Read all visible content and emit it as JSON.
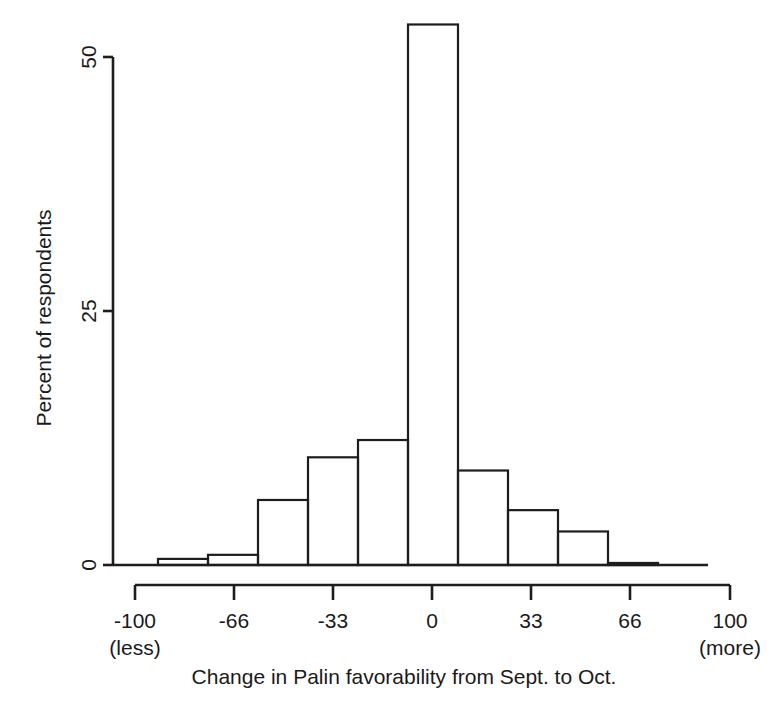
{
  "chart_data": {
    "type": "bar",
    "title": "",
    "subtitle": "",
    "xlabel": "Change in Palin favorability from Sept. to Oct.",
    "ylabel": "Percent of respondents",
    "xlim": [
      -110,
      110
    ],
    "ylim": [
      0,
      55
    ],
    "grid": false,
    "legend": null,
    "x_ticks": [
      {
        "value": -100,
        "label": "-100",
        "sublabel": "(less)"
      },
      {
        "value": -66,
        "label": "-66",
        "sublabel": ""
      },
      {
        "value": -33,
        "label": "-33",
        "sublabel": ""
      },
      {
        "value": 0,
        "label": "0",
        "sublabel": ""
      },
      {
        "value": 33,
        "label": "33",
        "sublabel": ""
      },
      {
        "value": 66,
        "label": "66",
        "sublabel": ""
      },
      {
        "value": 100,
        "label": "100",
        "sublabel": "(more)"
      }
    ],
    "y_ticks": [
      {
        "value": 0,
        "label": "0"
      },
      {
        "value": 25,
        "label": "25"
      },
      {
        "value": 50,
        "label": "50"
      }
    ],
    "bins": [
      {
        "x0": -93,
        "x1": -77,
        "value": 0.6
      },
      {
        "x0": -77,
        "x1": -60,
        "value": 1.0
      },
      {
        "x0": -60,
        "x1": -44,
        "value": 6.4
      },
      {
        "x0": -44,
        "x1": -27,
        "value": 10.6
      },
      {
        "x0": -27,
        "x1": -11,
        "value": 12.3
      },
      {
        "x0": -11,
        "x1": 6,
        "value": 53.2
      },
      {
        "x0": 6,
        "x1": 22,
        "value": 9.3
      },
      {
        "x0": 22,
        "x1": 39,
        "value": 5.4
      },
      {
        "x0": 39,
        "x1": 55,
        "value": 3.3
      },
      {
        "x0": 55,
        "x1": 72,
        "value": 0.2
      }
    ],
    "categories": [
      "-93..-77",
      "-77..-60",
      "-60..-44",
      "-44..-27",
      "-27..-11",
      "-11..6",
      "6..22",
      "22..39",
      "39..55",
      "55..72"
    ],
    "values": [
      0.6,
      1.0,
      6.4,
      10.6,
      12.3,
      53.2,
      9.3,
      5.4,
      3.3,
      0.2
    ],
    "colors": {
      "stroke": "#1d1d1d",
      "fill": "#ffffff",
      "background": "#ffffff"
    }
  },
  "geometry": {
    "plot_left": 113,
    "plot_baseline_y": 565,
    "plot_y_top": 57,
    "y_units_per_tick": 25,
    "px_per_unit": 10.16,
    "bar_start_x": 158,
    "bar_width": 50,
    "baseline_right_x": 708,
    "xaxis_bar_y": 585,
    "xaxis_left": 135,
    "xaxis_right": 730,
    "xaxis_tick_spacing": 100
  }
}
